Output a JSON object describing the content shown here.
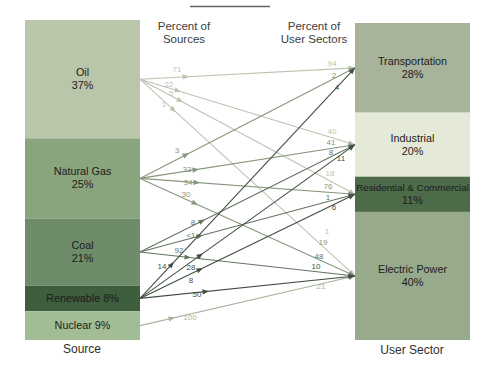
{
  "headers": {
    "left_line1": "Percent of",
    "left_line2": "Sources",
    "right_line1": "Percent of",
    "right_line2": "User Sectors"
  },
  "axis": {
    "source": "Source",
    "user_sector": "User Sector"
  },
  "chart_data": {
    "type": "flow",
    "sources": [
      {
        "id": "oil",
        "label": "Oil",
        "pct": 37,
        "pct_label": "37%",
        "color": "#b9c6aa",
        "arrow_color": "#bdc4b1"
      },
      {
        "id": "natural_gas",
        "label": "Natural Gas",
        "pct": 25,
        "pct_label": "25%",
        "color": "#8aa47d",
        "arrow_color": "#87967e"
      },
      {
        "id": "coal",
        "label": "Coal",
        "pct": 21,
        "pct_label": "21%",
        "color": "#6f8c6a",
        "arrow_color": "#637560"
      },
      {
        "id": "renewable",
        "label": "Renewable 8%",
        "pct": 8,
        "pct_label": null,
        "color": "#3e5e3d",
        "arrow_color": "#414f43"
      },
      {
        "id": "nuclear",
        "label": "Nuclear 9%",
        "pct": 9,
        "pct_label": null,
        "color": "#a2bd96",
        "arrow_color": "#a9b59e"
      }
    ],
    "sectors": [
      {
        "id": "transportation",
        "label": "Transportation",
        "pct": 28,
        "pct_label": "28%",
        "color": "#a7b39a"
      },
      {
        "id": "industrial",
        "label": "Industrial",
        "pct": 20,
        "pct_label": "20%",
        "color": "#e4ead7"
      },
      {
        "id": "residential_commercial",
        "label": "Residential & Commercial",
        "pct": 11,
        "pct_label": "11%",
        "color": "#4d6a49"
      },
      {
        "id": "electric_power",
        "label": "Electric Power",
        "pct": 40,
        "pct_label": "40%",
        "color": "#98aa8c"
      }
    ],
    "flows": [
      {
        "source": "oil",
        "sector": "transportation",
        "percent_of_source": "71",
        "percent_of_sector": "94",
        "spos": [
          177,
          69
        ],
        "tpos": [
          332,
          63
        ]
      },
      {
        "source": "oil",
        "sector": "industrial",
        "percent_of_source": "22",
        "percent_of_sector": "40",
        "spos": [
          169,
          84
        ],
        "tpos": [
          332,
          131
        ]
      },
      {
        "source": "oil",
        "sector": "residential_commercial",
        "percent_of_source": "5",
        "percent_of_sector": "18",
        "spos": [
          171,
          93
        ],
        "tpos": [
          330,
          173
        ]
      },
      {
        "source": "oil",
        "sector": "electric_power",
        "percent_of_source": "1",
        "percent_of_sector": "1",
        "spos": [
          164,
          104
        ],
        "tpos": [
          327,
          231
        ]
      },
      {
        "source": "natural_gas",
        "sector": "transportation",
        "percent_of_source": "3",
        "percent_of_sector": "2",
        "spos": [
          177,
          150
        ],
        "tpos": [
          334,
          75
        ]
      },
      {
        "source": "natural_gas",
        "sector": "industrial",
        "percent_of_source": "33",
        "percent_of_sector": "41",
        "spos": [
          187,
          169
        ],
        "tpos": [
          331,
          142
        ]
      },
      {
        "source": "natural_gas",
        "sector": "residential_commercial",
        "percent_of_source": "34",
        "percent_of_sector": "76",
        "spos": [
          188,
          182
        ],
        "tpos": [
          328,
          186
        ]
      },
      {
        "source": "natural_gas",
        "sector": "electric_power",
        "percent_of_source": "30",
        "percent_of_sector": "19",
        "spos": [
          186,
          194
        ],
        "tpos": [
          323,
          242
        ]
      },
      {
        "source": "coal",
        "sector": "industrial",
        "percent_of_source": "8",
        "percent_of_sector": "8",
        "spos": [
          193,
          222
        ],
        "tpos": [
          331,
          152
        ]
      },
      {
        "source": "coal",
        "sector": "residential_commercial",
        "percent_of_source": "<1",
        "percent_of_sector": "1",
        "spos": [
          191,
          235
        ],
        "tpos": [
          328,
          197
        ]
      },
      {
        "source": "coal",
        "sector": "electric_power",
        "percent_of_source": "92",
        "percent_of_sector": "48",
        "spos": [
          179,
          250
        ],
        "tpos": [
          319,
          256
        ]
      },
      {
        "source": "renewable",
        "sector": "transportation",
        "percent_of_source": "14",
        "percent_of_sector": "4",
        "spos": [
          162,
          266
        ],
        "tpos": [
          337,
          87
        ]
      },
      {
        "source": "renewable",
        "sector": "industrial",
        "percent_of_source": "28",
        "percent_of_sector": "11",
        "spos": [
          191,
          267
        ],
        "tpos": [
          341,
          158
        ]
      },
      {
        "source": "renewable",
        "sector": "residential_commercial",
        "percent_of_source": "8",
        "percent_of_sector": "6",
        "spos": [
          191,
          280
        ],
        "tpos": [
          334,
          207
        ]
      },
      {
        "source": "renewable",
        "sector": "electric_power",
        "percent_of_source": "50",
        "percent_of_sector": "10",
        "spos": [
          197,
          294
        ],
        "tpos": [
          316,
          266
        ]
      },
      {
        "source": "nuclear",
        "sector": "electric_power",
        "percent_of_source": "100",
        "percent_of_sector": "21",
        "spos": [
          190,
          317
        ],
        "tpos": [
          321,
          286
        ],
        "ax": 175
      }
    ]
  }
}
